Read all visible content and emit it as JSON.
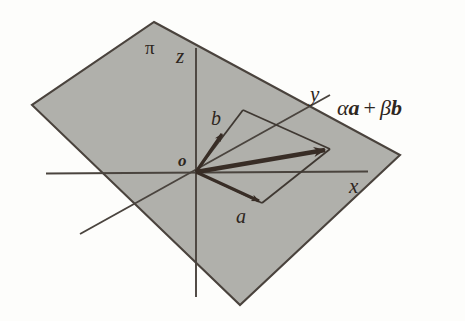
{
  "figure": {
    "colors": {
      "background": "#fdfdfb",
      "plane_fill": "#b0b0ab",
      "plane_edge": "#4a433d",
      "axis": "#4a443e",
      "vector": "#382d26",
      "thin_line": "#3f3832",
      "text": "#2e2620"
    },
    "labels": {
      "plane": "π",
      "axis_z": "z",
      "axis_x": "x",
      "axis_y": "y",
      "origin": "o",
      "vector_a": "a",
      "vector_b": "b",
      "combination_alpha": "α",
      "combination_a": "a",
      "combination_plus": "+",
      "combination_beta": "β",
      "combination_b": "b"
    },
    "geometry": {
      "plane_vertices": [
        [
          154,
          22
        ],
        [
          400,
          155
        ],
        [
          240,
          305
        ],
        [
          32,
          105
        ]
      ],
      "origin": [
        196,
        172
      ],
      "z_axis": [
        [
          196,
          48
        ],
        [
          196,
          297
        ]
      ],
      "x_axis": [
        [
          46,
          173
        ],
        [
          368,
          172
        ]
      ],
      "y_axis": [
        [
          80,
          234
        ],
        [
          330,
          95
        ]
      ],
      "vector_a_tip": [
        262,
        203
      ],
      "vector_b_tip": [
        223,
        133
      ],
      "resultant_tip": [
        330,
        149
      ],
      "parallelogram": [
        [
          196,
          172
        ],
        [
          262,
          203
        ],
        [
          330,
          149
        ],
        [
          243,
          110
        ]
      ]
    }
  }
}
